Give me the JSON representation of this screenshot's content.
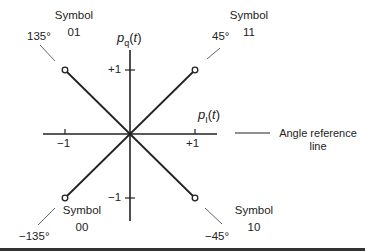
{
  "diagram": {
    "type": "QPSK signal constellation (phasor diagram)",
    "axes": {
      "horizontal": {
        "label_main": "p",
        "label_sub": "I",
        "label_suffix": "(t)",
        "ticks": [
          "−1",
          "+1"
        ]
      },
      "vertical": {
        "label_main": "p",
        "label_sub": "q",
        "label_suffix": "(t)",
        "ticks": [
          "+1",
          "−1"
        ]
      }
    },
    "reference": {
      "label_line1": "Angle reference",
      "label_line2": "line"
    },
    "symbols": [
      {
        "name": "Symbol",
        "code": "01",
        "angle": "135°",
        "x": -1,
        "y": 1
      },
      {
        "name": "Symbol",
        "code": "11",
        "angle": "45°",
        "x": 1,
        "y": 1
      },
      {
        "name": "Symbol",
        "code": "00",
        "angle": "−135°",
        "x": -1,
        "y": -1
      },
      {
        "name": "Symbol",
        "code": "10",
        "angle": "−45°",
        "x": 1,
        "y": -1
      }
    ],
    "colors": {
      "line": "#222222",
      "background": "#ffffff"
    }
  }
}
